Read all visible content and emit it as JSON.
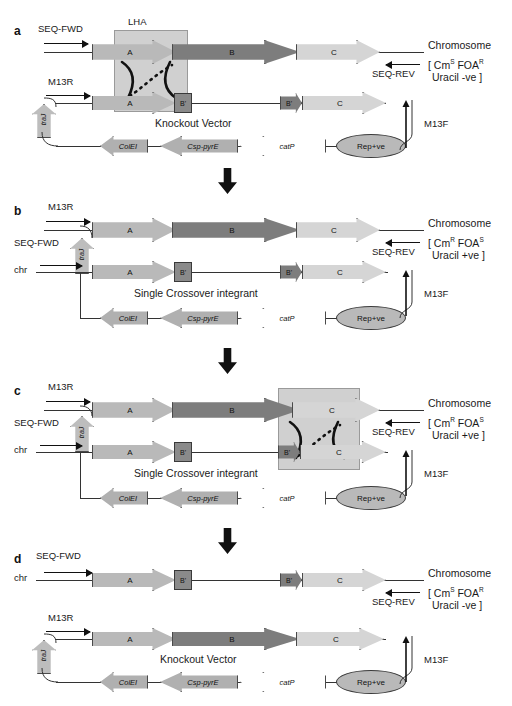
{
  "figure": {
    "type": "molecular-biology-schematic",
    "panels": [
      "a",
      "b",
      "c",
      "d"
    ],
    "step_arrow": "down-arrow"
  },
  "genes": {
    "A": "A",
    "B": "B",
    "C": "C",
    "B_prime": "B'",
    "B_prime2": "B'"
  },
  "vector_elements": {
    "colei": "ColEI",
    "csp_pyre": "Csp-pyrE",
    "catp": "catP",
    "rep": "Rep+ve",
    "traj": "traJ"
  },
  "primers": {
    "seq_fwd": "SEQ-FWD",
    "seq_rev": "SEQ-REV",
    "m13r": "M13R",
    "m13f": "M13F",
    "chr": "chr"
  },
  "panels": {
    "a": {
      "letter": "a",
      "homology_arm_label": "LHA",
      "lower_label": "Knockout Vector",
      "chromosome_label": "Chromosome",
      "phenotype_line1_pre": "[ Cm",
      "phenotype_line1_sup1": "S",
      "phenotype_line1_mid": " FOA",
      "phenotype_line1_sup2": "R",
      "phenotype_line2": "Uracil -ve  ]"
    },
    "b": {
      "letter": "b",
      "lower_label": "Single  Crossover integrant",
      "chromosome_label": "Chromosome",
      "phenotype_line1_pre": "[ Cm",
      "phenotype_line1_sup1": "R",
      "phenotype_line1_mid": " FOA",
      "phenotype_line1_sup2": "S",
      "phenotype_line2": "Uracil +ve  ]"
    },
    "c": {
      "letter": "c",
      "lower_label": "Single  Crossover integrant",
      "chromosome_label": "Chromosome",
      "phenotype_line1_pre": "[ Cm",
      "phenotype_line1_sup1": "R",
      "phenotype_line1_mid": " FOA",
      "phenotype_line1_sup2": "S",
      "phenotype_line2": "Uracil +ve  ]"
    },
    "d": {
      "letter": "d",
      "lower_label": "Knockout Vector",
      "chromosome_label": "Chromosome",
      "phenotype_line1_pre": "[ Cm",
      "phenotype_line1_sup1": "S",
      "phenotype_line1_mid": " FOA",
      "phenotype_line1_sup2": "R",
      "phenotype_line2": "Uracil -ve  ]"
    }
  },
  "colors": {
    "gene_a": "#b9b9b9",
    "gene_b": "#7d7d7d",
    "gene_c": "#d5d5d5",
    "box": "#8a8a8a",
    "white": "#ffffff",
    "outline": "#4a4a4a",
    "homology_box": "#aaaaaa"
  }
}
